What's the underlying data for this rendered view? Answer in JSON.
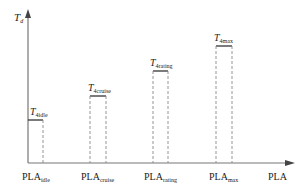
{
  "diagram": {
    "y_axis": {
      "symbol": "T",
      "subscript": "d"
    },
    "x_axis": {
      "label": "PLA"
    },
    "levels": [
      {
        "id": "idle",
        "t_symbol": "T",
        "t_sub": "4idle",
        "x_symbol": "PLA",
        "x_sub": "idle"
      },
      {
        "id": "cruise",
        "t_symbol": "T",
        "t_sub": "4cruise",
        "x_symbol": "PLA",
        "x_sub": "cruise"
      },
      {
        "id": "rating",
        "t_symbol": "T",
        "t_sub": "4rating",
        "x_symbol": "PLA",
        "x_sub": "rating"
      },
      {
        "id": "max",
        "t_symbol": "T",
        "t_sub": "4max",
        "x_symbol": "PLA",
        "x_sub": "max"
      }
    ],
    "colors": {
      "axis": "#666666",
      "solid": "#333333",
      "dashed": "#888888"
    }
  }
}
